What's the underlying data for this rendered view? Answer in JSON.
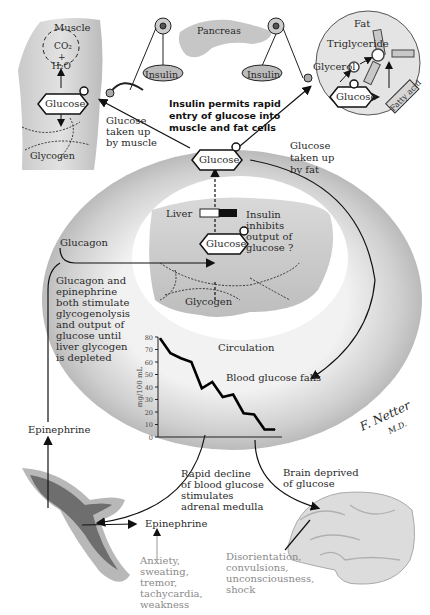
{
  "organs": {
    "muscle": "Muscle",
    "pancreas": "Pancreas",
    "fat": "Fat",
    "liver": "Liver",
    "circulation": "Circulation"
  },
  "muscle": {
    "co2": "CO₂",
    "plus": "+",
    "h2o": "H₂O",
    "glucose": "Glucose",
    "glycogen": "Glycogen",
    "uptake": [
      "Glucose",
      "taken up",
      "by muscle"
    ]
  },
  "pancreas": {
    "insulin_left": "Insulin",
    "insulin_right": "Insulin",
    "caption": [
      "Insulin permits rapid",
      "entry of glucose into",
      "muscle and fat cells"
    ]
  },
  "fat": {
    "triglyceride": "Triglyceride",
    "glycerol": "Glycerol",
    "glucose": "Glucose",
    "fatty_acid": "Fatty acid",
    "uptake": [
      "Glucose",
      "taken up",
      "by fat"
    ]
  },
  "blood": {
    "glucose": "Glucose"
  },
  "liver": {
    "glucose": "Glucose",
    "glycogen": "Glycogen",
    "insulin_note": [
      "Insulin",
      "inhibits",
      "output of",
      "glucose ?"
    ]
  },
  "glucagon": {
    "label": "Glucagon",
    "note": [
      "Glucagon and",
      "epinephrine",
      "both stimulate",
      "glycogenolysis",
      "and output of",
      "glucose until",
      "liver glycogen",
      "is depleted"
    ]
  },
  "epinephrine_top": "Epinephrine",
  "blood_glucose_falls": "Blood glucose falls",
  "adrenal": {
    "note": [
      "Rapid decline",
      "of blood glucose",
      "stimulates",
      "adrenal medulla"
    ],
    "epinephrine": "Epinephrine",
    "symptoms": [
      "Anxiety,",
      "sweating,",
      "tremor,",
      "tachycardia,",
      "weakness"
    ]
  },
  "brain": {
    "note": [
      "Brain deprived",
      "of glucose"
    ],
    "symptoms": [
      "Disorientation,",
      "convulsions,",
      "unconsciousness,",
      "shock"
    ]
  },
  "signature": [
    "F. Netter",
    "M.D."
  ],
  "chart_data": {
    "type": "line",
    "title": "",
    "xlabel": "",
    "ylabel": "mg/100 mL",
    "ylim": [
      0,
      80
    ],
    "yticks": [
      0,
      10,
      20,
      30,
      40,
      50,
      60,
      70,
      80
    ],
    "x": [
      0,
      1,
      2,
      3,
      4,
      5,
      6,
      7,
      8,
      9,
      10,
      11
    ],
    "series": [
      {
        "name": "Blood glucose",
        "values": [
          79,
          67,
          63,
          60,
          39,
          44,
          32,
          34,
          19,
          18,
          6,
          6
        ]
      }
    ],
    "grid": false
  }
}
